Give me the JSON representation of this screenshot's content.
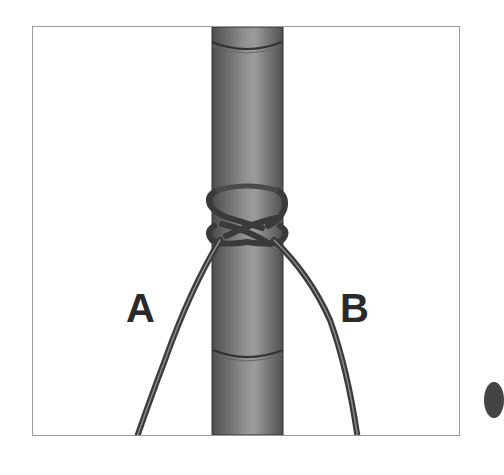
{
  "diagram": {
    "labels": {
      "a": "A",
      "b": "B"
    },
    "colors": {
      "pole_dark": "#5f5f5f",
      "pole_light": "#9a9a9a",
      "rope": "#3a3a3a",
      "frame_border": "#9a9a9a",
      "label": "#2a2a2a"
    }
  }
}
